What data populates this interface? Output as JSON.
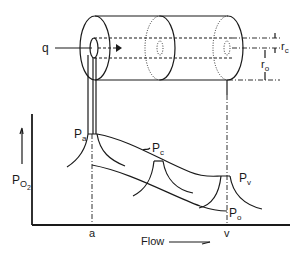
{
  "diagram": {
    "cylinder": {
      "flow_label": "q",
      "radius_capillary_label": "r",
      "radius_capillary_sub": "c",
      "radius_tissue_label": "r",
      "radius_tissue_sub": "o"
    },
    "graph": {
      "y_axis_label": "P",
      "y_axis_sub": "O",
      "y_axis_sub2": "2",
      "x_axis_label": "Flow",
      "x_tick_arterial": "a",
      "x_tick_venous": "v",
      "curve_labels": {
        "arterial": {
          "main": "P",
          "sub": "a"
        },
        "capillary": {
          "main": "P",
          "sub": "c"
        },
        "venous": {
          "main": "P",
          "sub": "v"
        },
        "tissue_edge": {
          "main": "P",
          "sub": "o"
        }
      }
    },
    "colors": {
      "ink": "#1a1a1a",
      "background": "#ffffff"
    }
  }
}
